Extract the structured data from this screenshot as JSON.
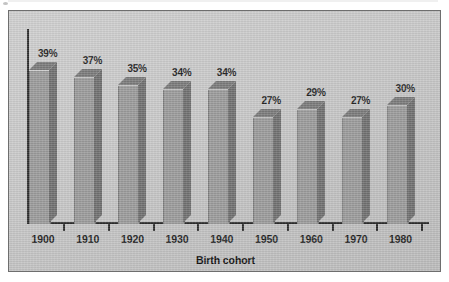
{
  "chart_data": {
    "type": "bar",
    "title": "",
    "subtitle": "",
    "xlabel": "Birth cohort",
    "ylabel": "",
    "categories": [
      "1900",
      "1910",
      "1920",
      "1930",
      "1940",
      "1950",
      "1960",
      "1970",
      "1980"
    ],
    "values": [
      39,
      37,
      35,
      34,
      34,
      27,
      29,
      27,
      30
    ],
    "value_labels": [
      "39%",
      "37%",
      "35%",
      "34%",
      "34%",
      "27%",
      "29%",
      "27%",
      "30%"
    ],
    "unit": "%",
    "ylim": [
      0,
      45
    ],
    "grid": false,
    "legend": null,
    "legend_position": "none",
    "style": "3d-bar",
    "axis_ticks_between_categories": true,
    "series": [
      {
        "name": "",
        "values": [
          39,
          37,
          35,
          34,
          34,
          27,
          29,
          27,
          30
        ]
      }
    ]
  },
  "figure": {
    "panel_border_color": "#6e6e6e",
    "panel_background_color": "#c6c6c6",
    "axis_color": "#2c2c2c",
    "bar_front_color": "#9a9a9a",
    "bar_side_color": "#6f6f6f",
    "bar_top_color": "#7a7a7a",
    "text_color": "#1f1f1f"
  },
  "axis_title": {
    "text": "Birth cohort"
  }
}
